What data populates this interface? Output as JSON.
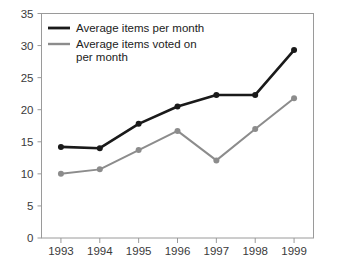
{
  "chart_data": {
    "type": "line",
    "title": "",
    "xlabel": "",
    "ylabel": "",
    "categories": [
      "1993",
      "1994",
      "1995",
      "1996",
      "1997",
      "1998",
      "1999"
    ],
    "ylim": [
      0,
      35
    ],
    "y_ticks": [
      "0",
      "5",
      "10",
      "15",
      "20",
      "25",
      "30",
      "35"
    ],
    "grid": false,
    "legend_position": "top-left-inside",
    "series": [
      {
        "name": "Average items per month",
        "color": "#1a1a1a",
        "values": [
          14.2,
          14.0,
          17.8,
          20.5,
          22.3,
          22.3,
          29.3
        ]
      },
      {
        "name": "Average items voted on per month",
        "color": "#8c8c8c",
        "values": [
          10.0,
          10.7,
          13.7,
          16.7,
          12.1,
          17.0,
          21.8
        ]
      }
    ]
  },
  "legend": {
    "entries": [
      {
        "line1": "Average items per month",
        "line2": ""
      },
      {
        "line1": "Average items voted on",
        "line2": "per month"
      }
    ]
  },
  "colors": {
    "series_primary": "#1a1a1a",
    "series_secondary": "#8c8c8c",
    "frame": "#9a9a9a",
    "text": "#3a3a3a",
    "background": "#ffffff"
  }
}
